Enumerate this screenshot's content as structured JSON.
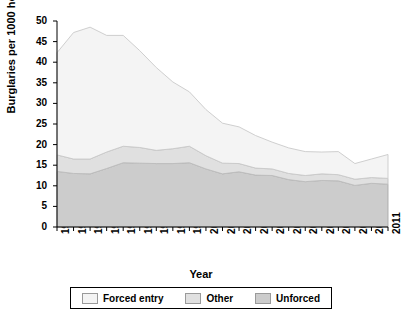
{
  "chart_data": {
    "type": "area",
    "stacked": true,
    "title": "",
    "xlabel": "Year",
    "ylabel": "Burglaries per 1000 households",
    "categories": [
      "1991",
      "1992",
      "1993",
      "1994",
      "1995",
      "1996",
      "1997",
      "1998",
      "1999",
      "2000",
      "2001",
      "2002",
      "2003",
      "2004",
      "2005",
      "2006",
      "2007",
      "2008",
      "2009",
      "2010",
      "2011"
    ],
    "x": [
      1991,
      1992,
      1993,
      1994,
      1995,
      1996,
      1997,
      1998,
      1999,
      2000,
      2001,
      2002,
      2003,
      2004,
      2005,
      2006,
      2007,
      2008,
      2009,
      2010,
      2011
    ],
    "ylim": [
      0,
      50
    ],
    "xlim": [
      1991,
      2011
    ],
    "yticks": [
      0,
      5,
      10,
      15,
      20,
      25,
      30,
      35,
      40,
      45,
      50
    ],
    "grid": false,
    "legend_position": "bottom",
    "series": [
      {
        "name": "Unforced",
        "color": "#cccccc",
        "edge_color": "#a8a8a8",
        "values": [
          13.5,
          13.0,
          12.9,
          14.2,
          15.6,
          15.5,
          15.4,
          15.4,
          15.6,
          14.1,
          12.9,
          13.4,
          12.6,
          12.5,
          11.5,
          11.0,
          11.3,
          11.2,
          10.1,
          10.6,
          10.4
        ]
      },
      {
        "name": "Other",
        "color": "#e0e0e0",
        "edge_color": "#bdbdbd",
        "values": [
          4.0,
          3.5,
          3.6,
          4.0,
          4.0,
          3.8,
          3.2,
          3.6,
          4.0,
          3.2,
          2.6,
          2.0,
          1.7,
          1.6,
          1.5,
          1.5,
          1.6,
          1.5,
          1.5,
          1.4,
          1.4
        ]
      },
      {
        "name": "Forced entry",
        "color": "#f4f4f4",
        "edge_color": "#c9c9c9",
        "values": [
          24.8,
          30.7,
          32.0,
          28.3,
          26.9,
          23.5,
          20.1,
          16.2,
          13.2,
          11.2,
          9.7,
          8.9,
          7.9,
          6.5,
          6.2,
          5.8,
          5.3,
          5.6,
          3.8,
          4.5,
          5.8
        ]
      }
    ],
    "totals": [
      42.3,
      47.2,
      48.5,
      46.5,
      46.5,
      42.8,
      38.7,
      35.2,
      32.8,
      28.5,
      25.2,
      24.3,
      22.2,
      20.6,
      19.2,
      18.3,
      18.2,
      18.3,
      15.4,
      16.5,
      17.6
    ],
    "legend": [
      {
        "label": "Forced entry",
        "color": "#f4f4f4"
      },
      {
        "label": "Other",
        "color": "#e0e0e0"
      },
      {
        "label": "Unforced",
        "color": "#cccccc"
      }
    ]
  }
}
